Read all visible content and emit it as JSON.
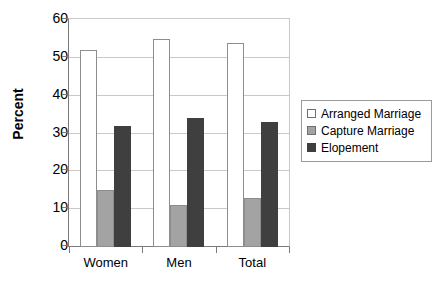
{
  "chart_data": {
    "type": "bar",
    "title": "",
    "subtitle": "",
    "xlabel": "",
    "ylabel": "Percent",
    "categories": [
      "Women",
      "Men",
      "Total"
    ],
    "series": [
      {
        "name": "Arranged Marriage",
        "values": [
          52,
          55,
          54
        ],
        "color": "#ffffff"
      },
      {
        "name": "Capture Marriage",
        "values": [
          15,
          11,
          13
        ],
        "color": "#a3a3a3"
      },
      {
        "name": "Elopement",
        "values": [
          32,
          34,
          33
        ],
        "color": "#3f3f3f"
      }
    ],
    "ylim": [
      0,
      60
    ],
    "y_ticks": [
      0,
      10,
      20,
      30,
      40,
      50,
      60
    ],
    "y_tick_labels": [
      "0",
      "10",
      "20",
      "30",
      "40",
      "50",
      "60"
    ],
    "grid": "horizontal",
    "legend_position": "right",
    "annotations": []
  },
  "legend": {
    "items": [
      {
        "label": "Arranged Marriage",
        "swatch": "arranged"
      },
      {
        "label": "Capture Marriage",
        "swatch": "capture"
      },
      {
        "label": "Elopement",
        "swatch": "elopement"
      }
    ]
  },
  "axis": {
    "y_title": "Percent"
  },
  "colors": {
    "arranged": "#ffffff",
    "capture": "#a3a3a3",
    "elopement": "#3f3f3f",
    "grid": "#c9c9c9",
    "axis": "#7a7a7a",
    "text": "#000000"
  }
}
